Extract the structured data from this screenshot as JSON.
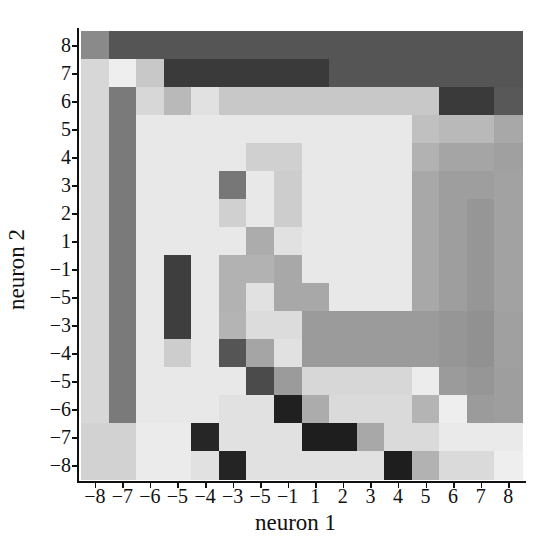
{
  "chart_data": {
    "type": "heatmap",
    "title": "",
    "xlabel": "neuron 1",
    "ylabel": "neuron 2",
    "x_tick_labels": [
      "-8",
      "-7",
      "-6",
      "-5",
      "-4",
      "-3",
      "-5",
      "-1",
      "1",
      "2",
      "3",
      "4",
      "5",
      "6",
      "7",
      "8"
    ],
    "y_tick_labels": [
      "8",
      "7",
      "6",
      "5",
      "4",
      "3",
      "2",
      "1",
      "-1",
      "-5",
      "-3",
      "-4",
      "-5",
      "-6",
      "-7",
      "-8"
    ],
    "colormap": "grayscale (darker = higher value)",
    "grid": false,
    "legend": "none",
    "value_encoding": "gray level 0-255 per cell; rows top(8) to bottom(-8), columns left(-8) to right(8)",
    "values": [
      [
        138,
        85,
        85,
        85,
        85,
        85,
        85,
        85,
        85,
        85,
        85,
        85,
        85,
        85,
        85,
        85
      ],
      [
        215,
        238,
        200,
        58,
        58,
        58,
        58,
        58,
        58,
        85,
        85,
        85,
        85,
        85,
        85,
        85
      ],
      [
        215,
        122,
        215,
        185,
        225,
        200,
        200,
        200,
        200,
        200,
        200,
        200,
        200,
        58,
        58,
        88
      ],
      [
        215,
        122,
        232,
        232,
        232,
        232,
        232,
        232,
        232,
        232,
        232,
        232,
        192,
        185,
        185,
        168
      ],
      [
        215,
        122,
        232,
        232,
        232,
        232,
        208,
        208,
        232,
        232,
        232,
        232,
        178,
        165,
        165,
        160
      ],
      [
        215,
        122,
        232,
        232,
        232,
        119,
        232,
        205,
        232,
        232,
        232,
        232,
        168,
        158,
        158,
        162
      ],
      [
        215,
        122,
        232,
        232,
        232,
        208,
        232,
        205,
        232,
        232,
        232,
        232,
        168,
        158,
        150,
        162
      ],
      [
        215,
        122,
        232,
        232,
        232,
        232,
        172,
        225,
        232,
        232,
        232,
        232,
        168,
        158,
        150,
        162
      ],
      [
        215,
        122,
        232,
        62,
        232,
        178,
        178,
        168,
        232,
        232,
        232,
        232,
        168,
        158,
        150,
        162
      ],
      [
        215,
        122,
        232,
        62,
        232,
        178,
        225,
        168,
        168,
        232,
        232,
        232,
        168,
        158,
        150,
        162
      ],
      [
        215,
        122,
        232,
        62,
        232,
        180,
        220,
        220,
        155,
        155,
        155,
        155,
        155,
        150,
        145,
        160
      ],
      [
        215,
        122,
        232,
        205,
        232,
        85,
        165,
        225,
        155,
        155,
        155,
        155,
        155,
        150,
        145,
        160
      ],
      [
        215,
        122,
        232,
        232,
        232,
        232,
        75,
        155,
        215,
        215,
        215,
        215,
        236,
        155,
        150,
        158
      ],
      [
        215,
        122,
        232,
        232,
        232,
        225,
        225,
        32,
        172,
        218,
        218,
        218,
        180,
        238,
        155,
        158
      ],
      [
        210,
        210,
        235,
        235,
        38,
        225,
        225,
        225,
        30,
        30,
        168,
        218,
        218,
        234,
        234,
        234
      ],
      [
        210,
        210,
        235,
        235,
        225,
        36,
        225,
        225,
        225,
        225,
        225,
        30,
        178,
        218,
        218,
        238
      ]
    ]
  }
}
